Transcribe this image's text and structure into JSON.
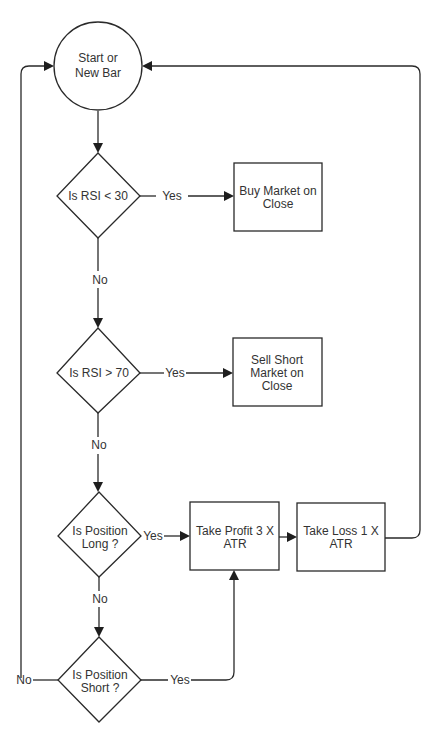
{
  "diagram": {
    "type": "flowchart",
    "nodes": {
      "start": {
        "shape": "circle",
        "lines": [
          "Start or",
          "New Bar"
        ]
      },
      "rsi_low": {
        "shape": "diamond",
        "lines": [
          "Is RSI < 30"
        ]
      },
      "buy": {
        "shape": "rectangle",
        "lines": [
          "Buy Market on",
          "Close"
        ]
      },
      "rsi_high": {
        "shape": "diamond",
        "lines": [
          "Is RSI > 70"
        ]
      },
      "sell": {
        "shape": "rectangle",
        "lines": [
          "Sell Short",
          "Market on",
          "Close"
        ]
      },
      "pos_long": {
        "shape": "diamond",
        "lines": [
          "Is Position",
          "Long ?"
        ]
      },
      "take_profit": {
        "shape": "rectangle",
        "lines": [
          "Take Profit 3 X",
          "ATR"
        ]
      },
      "take_loss": {
        "shape": "rectangle",
        "lines": [
          "Take Loss 1 X",
          "ATR"
        ]
      },
      "pos_short": {
        "shape": "diamond",
        "lines": [
          "Is Position",
          "Short ?"
        ]
      }
    },
    "edge_labels": {
      "rsi_low_yes": "Yes",
      "rsi_low_no": "No",
      "rsi_high_yes": "Yes",
      "rsi_high_no": "No",
      "pos_long_yes": "Yes",
      "pos_long_no": "No",
      "pos_short_yes": "Yes",
      "pos_short_no": "No"
    },
    "edges": [
      {
        "from": "start",
        "to": "rsi_low"
      },
      {
        "from": "rsi_low",
        "to": "buy",
        "label": "Yes"
      },
      {
        "from": "rsi_low",
        "to": "rsi_high",
        "label": "No"
      },
      {
        "from": "rsi_high",
        "to": "sell",
        "label": "Yes"
      },
      {
        "from": "rsi_high",
        "to": "pos_long",
        "label": "No"
      },
      {
        "from": "pos_long",
        "to": "take_profit",
        "label": "Yes"
      },
      {
        "from": "pos_long",
        "to": "pos_short",
        "label": "No"
      },
      {
        "from": "pos_short",
        "to": "take_profit",
        "label": "Yes"
      },
      {
        "from": "pos_short",
        "to": "start",
        "label": "No"
      },
      {
        "from": "take_profit",
        "to": "take_loss"
      },
      {
        "from": "take_loss",
        "to": "start"
      }
    ]
  }
}
